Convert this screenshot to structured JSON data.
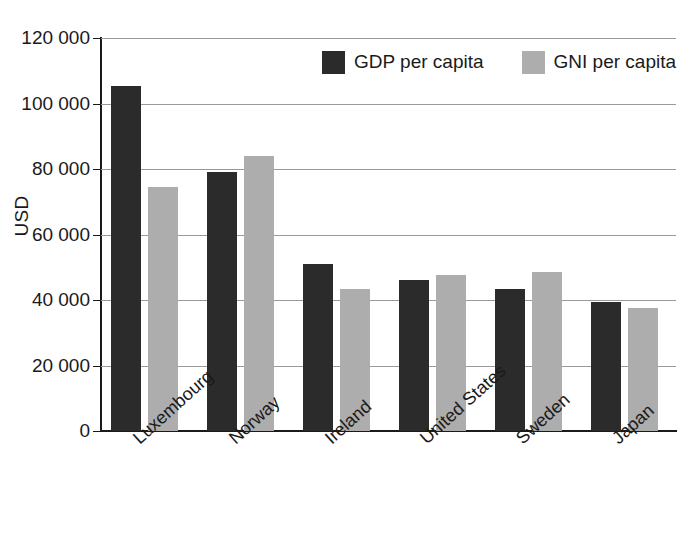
{
  "chart_data": {
    "type": "bar",
    "title": "",
    "xlabel": "",
    "ylabel": "USD",
    "ylim": [
      0,
      120000
    ],
    "ytick_step": 20000,
    "grid": true,
    "legend_position": "top-right-inside",
    "categories": [
      "Luxembourg",
      "Norway",
      "Ireland",
      "United States",
      "Sweden",
      "Japan"
    ],
    "series": [
      {
        "name": "GDP per capita",
        "color": "#2b2b2b",
        "values": [
          105500,
          79000,
          51000,
          46000,
          43500,
          39500
        ]
      },
      {
        "name": "GNI per capita",
        "color": "#adadad",
        "values": [
          74500,
          84000,
          43500,
          47500,
          48500,
          37500
        ]
      }
    ],
    "ytick_labels": [
      "0",
      "20 000",
      "40 000",
      "60 000",
      "80 000",
      "100 000",
      "120 000"
    ],
    "ytick_values": [
      0,
      20000,
      40000,
      60000,
      80000,
      100000,
      120000
    ]
  }
}
